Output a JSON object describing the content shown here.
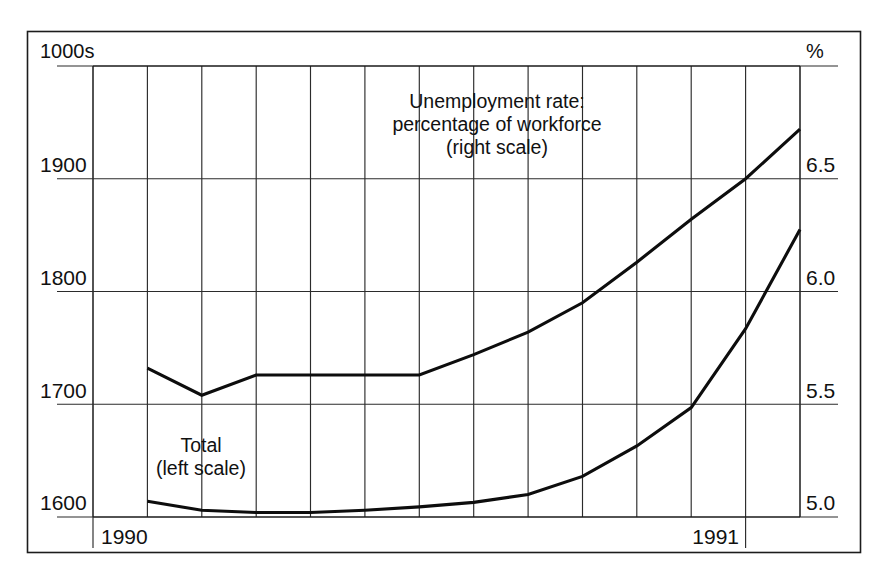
{
  "chart_data": {
    "type": "line",
    "title": "",
    "subtitle": "",
    "xlabel": "",
    "ylabel": "1000s",
    "y2label": "%",
    "grid": true,
    "legend_position": "inline-annotation",
    "x_tick_labels": [
      "1990",
      "1991"
    ],
    "x_tick_positions": [
      1,
      12
    ],
    "x": [
      0,
      1,
      2,
      3,
      4,
      5,
      6,
      7,
      8,
      9,
      10,
      11,
      12,
      13
    ],
    "left_axis": {
      "label": "1000s",
      "ticks": [
        1600,
        1700,
        1800,
        1900
      ],
      "tick_labels": [
        "1600",
        "1700",
        "1800",
        "1900"
      ],
      "ylim": [
        1600,
        2000
      ]
    },
    "right_axis": {
      "label": "%",
      "ticks": [
        5.0,
        5.5,
        6.0,
        6.5
      ],
      "tick_labels": [
        "5.0",
        "5.5",
        "6.0",
        "6.5"
      ],
      "ylim": [
        5.0,
        7.0
      ]
    },
    "series": [
      {
        "name": "Total (left scale)",
        "axis": "left",
        "label_line1": "Total",
        "label_line2": "(left scale)",
        "values": [
          1614,
          1606,
          1604,
          1604,
          1606,
          1609,
          1613,
          1620,
          1636,
          1663,
          1697,
          1767,
          1855,
          1990
        ]
      },
      {
        "name": "Unemployment rate: percentage of workforce (right scale)",
        "axis": "right",
        "label_line1": "Unemployment rate:",
        "label_line2": "percentage of workforce",
        "label_line3": "(right scale)",
        "values": [
          5.66,
          5.54,
          5.63,
          5.63,
          5.63,
          5.63,
          5.72,
          5.82,
          5.95,
          6.13,
          6.32,
          6.5,
          6.72,
          7.0
        ]
      }
    ]
  },
  "axis_labels": {
    "left_unit": "1000s",
    "right_unit": "%",
    "left_ticks": [
      "1900",
      "1800",
      "1700",
      "1600"
    ],
    "right_ticks": [
      "6.5",
      "6.0",
      "5.5",
      "5.0"
    ],
    "x_years": [
      "1990",
      "1991"
    ]
  },
  "annotations": {
    "unemployment": {
      "line1": "Unemployment rate:",
      "line2": "percentage of workforce",
      "line3": "(right scale)"
    },
    "total": {
      "line1": "Total",
      "line2": "(left scale)"
    }
  },
  "colors": {
    "line": "#0d0d0d",
    "grid": "#2b2b2b",
    "frame": "#1c1c1c",
    "background": "#ffffff"
  }
}
